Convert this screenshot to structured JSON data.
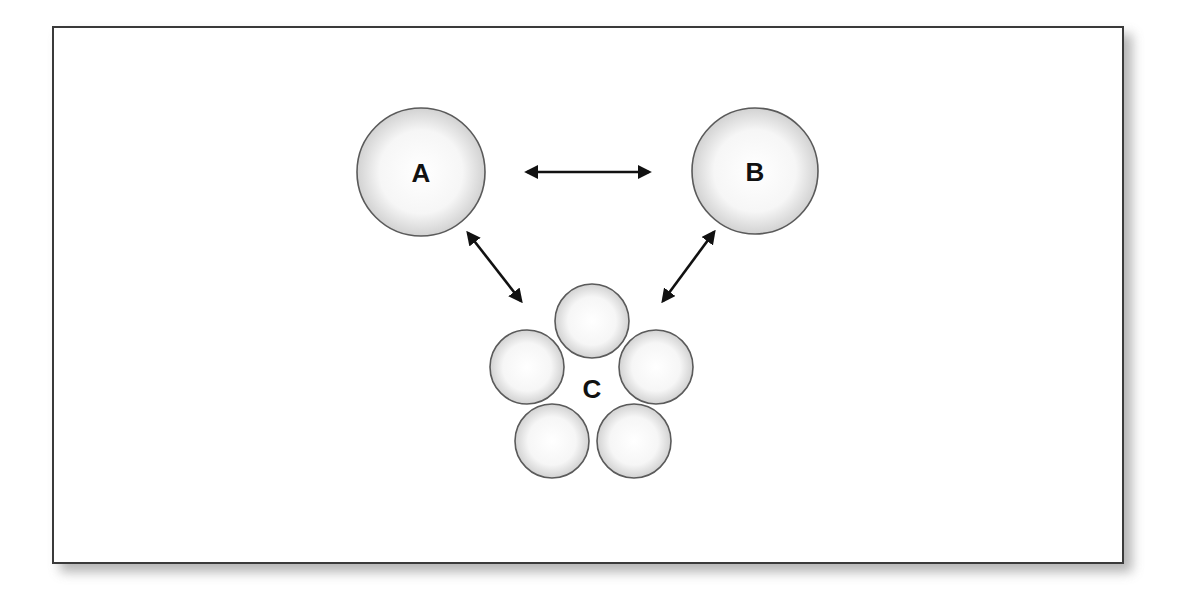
{
  "diagram": {
    "nodes": {
      "a": {
        "label": "A",
        "cx": 421,
        "cy": 172,
        "r": 64
      },
      "b": {
        "label": "B",
        "cx": 755,
        "cy": 171,
        "r": 63
      },
      "c": {
        "label": "C",
        "label_x": 592,
        "label_y": 398,
        "members": [
          {
            "cx": 592,
            "cy": 321,
            "r": 37
          },
          {
            "cx": 527,
            "cy": 367,
            "r": 37
          },
          {
            "cx": 656,
            "cy": 367,
            "r": 37
          },
          {
            "cx": 552,
            "cy": 441,
            "r": 37
          },
          {
            "cx": 634,
            "cy": 441,
            "r": 37
          }
        ]
      }
    },
    "edges": [
      {
        "from": "A",
        "to": "B",
        "type": "bidirectional"
      },
      {
        "from": "A",
        "to": "C",
        "type": "bidirectional"
      },
      {
        "from": "B",
        "to": "C",
        "type": "bidirectional"
      }
    ],
    "colors": {
      "node_fill_center": "#ffffff",
      "node_fill_edge": "#d4d4d4",
      "node_stroke": "#5a5a5a",
      "arrow": "#111111",
      "frame_border": "#3a3a3a"
    }
  }
}
